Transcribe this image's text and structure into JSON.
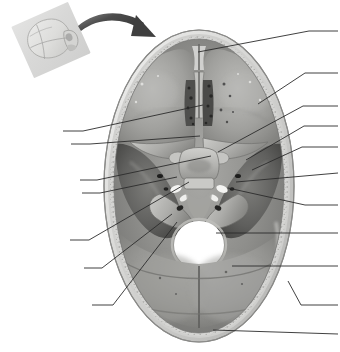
{
  "figure": {
    "view": "Superior view of the floor of the cranial cavity",
    "background_color": "#ffffff",
    "line_color": "#2b2b2b",
    "caption": ""
  },
  "inset": {
    "name": "orientation-skull-inset",
    "description": "Small tilted skull indicating the orientation of the main specimen",
    "plate_color": "#dcdcdb",
    "bone_color": "#d2d2d0"
  },
  "arrow": {
    "name": "orientation-arrow",
    "description": "Curved arrow sweeping from the inset skull toward the main specimen",
    "color": "#565656"
  },
  "specimen": {
    "name": "cranial-base-photograph",
    "description": "Grayscale photograph of the internal skull base showing anterior, middle and posterior cranial fossae",
    "regions": [
      {
        "name": "anterior-cranial-fossa-left",
        "label": ""
      },
      {
        "name": "anterior-cranial-fossa-right",
        "label": ""
      },
      {
        "name": "crista-galli",
        "label": ""
      },
      {
        "name": "cribriform-plate",
        "label": ""
      },
      {
        "name": "lesser-wing-of-sphenoid",
        "label": ""
      },
      {
        "name": "sella-turcica",
        "label": ""
      },
      {
        "name": "middle-cranial-fossa-left",
        "label": ""
      },
      {
        "name": "middle-cranial-fossa-right",
        "label": ""
      },
      {
        "name": "petrous-temporal-ridge",
        "label": ""
      },
      {
        "name": "foramen-magnum",
        "label": ""
      },
      {
        "name": "posterior-cranial-fossa",
        "label": ""
      },
      {
        "name": "occipital-diploe-margin",
        "label": ""
      }
    ]
  },
  "leaders": {
    "description": "Unlabeled leader lines radiating from structures to blank label positions at the figure margins",
    "right_count": 9,
    "left_count": 7,
    "total_count": 16,
    "right": [
      {
        "name": "leader-right-1",
        "label": "",
        "target": "frontal-crest-crista-galli"
      },
      {
        "name": "leader-right-2",
        "label": "",
        "target": "orbital-plate-frontal-bone"
      },
      {
        "name": "leader-right-3",
        "label": "",
        "target": "lesser-wing-of-sphenoid"
      },
      {
        "name": "leader-right-4",
        "label": "",
        "target": "anterior-clinoid-process"
      },
      {
        "name": "leader-right-5",
        "label": "",
        "target": "foramen-rotundum-region"
      },
      {
        "name": "leader-right-6",
        "label": "",
        "target": "foramen-ovale-spinosum"
      },
      {
        "name": "leader-right-7",
        "label": "",
        "target": "internal-acoustic-meatus"
      },
      {
        "name": "leader-right-8",
        "label": "",
        "target": "foramen-magnum"
      },
      {
        "name": "leader-right-9",
        "label": "",
        "target": "posterior-cranial-fossa"
      }
    ],
    "right_extra": [
      {
        "name": "leader-right-10",
        "label": "",
        "target": "inner-table-of-skull"
      },
      {
        "name": "leader-right-11",
        "label": "",
        "target": "occipital-bone-margin"
      }
    ],
    "left": [
      {
        "name": "leader-left-1",
        "label": "",
        "target": "cribriform-plate"
      },
      {
        "name": "leader-left-2",
        "label": "",
        "target": "sphenoid-body"
      },
      {
        "name": "leader-left-3",
        "label": "",
        "target": "optic-canal"
      },
      {
        "name": "leader-left-4",
        "label": "",
        "target": "sella-turcica"
      },
      {
        "name": "leader-left-5",
        "label": "",
        "target": "middle-cranial-fossa"
      },
      {
        "name": "leader-left-6",
        "label": "",
        "target": "petrous-part-temporal-bone"
      },
      {
        "name": "leader-left-7",
        "label": "",
        "target": "jugular-foramen-region"
      }
    ]
  }
}
